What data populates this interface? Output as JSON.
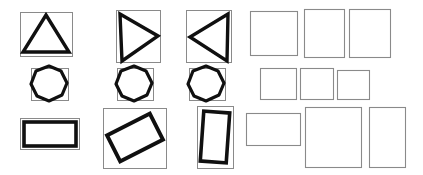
{
  "figure": {
    "background_color": "#ffffff",
    "shape_stroke_color": "#101010",
    "box_stroke_color": "#8a8a8a",
    "width": 423,
    "height": 175
  },
  "left_panel": {
    "name": "detected-shapes-panel",
    "rows": [
      {
        "row_label": "triangles",
        "cells": [
          {
            "shape": "triangle",
            "orientation": "up",
            "box": {
              "x": 20,
              "y": 12,
              "w": 52,
              "h": 44
            },
            "points": "46,15 69,52 23,52",
            "stroke_width": 3.4
          },
          {
            "shape": "triangle",
            "orientation": "right",
            "box": {
              "x": 116,
              "y": 10,
              "w": 44,
              "h": 52
            },
            "points": "120,14 158,36 122,61",
            "stroke_width": 3.4
          },
          {
            "shape": "triangle",
            "orientation": "left",
            "box": {
              "x": 186,
              "y": 10,
              "w": 45,
              "h": 52
            },
            "points": "228,14 190,37 227,61",
            "stroke_width": 3.4
          }
        ]
      },
      {
        "row_label": "circles",
        "cells": [
          {
            "shape": "circle",
            "orientation": "none",
            "box": {
              "x": 31,
              "y": 68,
              "w": 37,
              "h": 32
            },
            "center": {
              "cx": 49,
              "cy": 84
            },
            "radius": 18,
            "stroke_width": 3.2
          },
          {
            "shape": "circle",
            "orientation": "none",
            "box": {
              "x": 117,
              "y": 68,
              "w": 36,
              "h": 32
            },
            "center": {
              "cx": 134,
              "cy": 84
            },
            "radius": 18,
            "stroke_width": 3.2
          },
          {
            "shape": "circle",
            "orientation": "none",
            "box": {
              "x": 189,
              "y": 68,
              "w": 36,
              "h": 32
            },
            "center": {
              "cx": 206,
              "cy": 84
            },
            "radius": 18,
            "stroke_width": 3.2
          }
        ]
      },
      {
        "row_label": "rectangles",
        "cells": [
          {
            "shape": "rectangle",
            "orientation": "landscape",
            "rotation_deg": 0,
            "box": {
              "x": 21,
              "y": 119,
              "w": 58,
              "h": 30
            },
            "inner_rect": {
              "x": 23,
              "y": 121,
              "w": 54,
              "h": 26
            },
            "stroke_width": 3.4
          },
          {
            "shape": "rectangle",
            "orientation": "rotated",
            "rotation_deg": -27,
            "box": {
              "x": 103,
              "y": 108,
              "w": 63,
              "h": 60
            },
            "inner_rect": {
              "x": 111,
              "y": 123,
              "w": 48,
              "h": 29
            },
            "stroke_width": 3.8
          },
          {
            "shape": "rectangle",
            "orientation": "portrait-rotated",
            "rotation_deg": 5,
            "box": {
              "x": 197,
              "y": 106,
              "w": 36,
              "h": 62
            },
            "inner_rect": {
              "x": 202,
              "y": 112,
              "w": 26,
              "h": 50
            },
            "stroke_width": 3.6
          }
        ]
      }
    ]
  },
  "right_panel": {
    "name": "extracted-boxes-panel",
    "rows": [
      {
        "row_label": "row-1",
        "boxes": [
          {
            "label": "box-1-1",
            "x": 250,
            "y": 11,
            "w": 47,
            "h": 44
          },
          {
            "label": "box-1-2",
            "x": 304,
            "y": 9,
            "w": 40,
            "h": 48
          },
          {
            "label": "box-1-3",
            "x": 349,
            "y": 9,
            "w": 41,
            "h": 48
          }
        ]
      },
      {
        "row_label": "row-2",
        "boxes": [
          {
            "label": "box-2-1",
            "x": 260,
            "y": 68,
            "w": 36,
            "h": 31
          },
          {
            "label": "box-2-2",
            "x": 300,
            "y": 68,
            "w": 33,
            "h": 31
          },
          {
            "label": "box-2-3",
            "x": 337,
            "y": 70,
            "w": 32,
            "h": 29
          }
        ]
      },
      {
        "row_label": "row-3",
        "boxes": [
          {
            "label": "box-3-1",
            "x": 246,
            "y": 113,
            "w": 54,
            "h": 32
          },
          {
            "label": "box-3-2",
            "x": 305,
            "y": 107,
            "w": 56,
            "h": 60
          },
          {
            "label": "box-3-3",
            "x": 369,
            "y": 107,
            "w": 36,
            "h": 60
          }
        ]
      }
    ]
  }
}
